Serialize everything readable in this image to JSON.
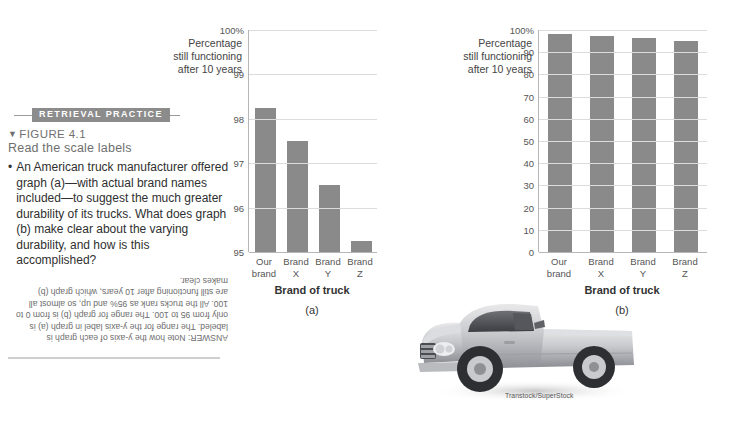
{
  "sidebar": {
    "badge": "RETRIEVAL PRACTICE",
    "figure_marker": "▼",
    "figure_number": "FIGURE 4.1",
    "figure_title": "Read the scale labels",
    "bullet_glyph": "•",
    "question": "An American truck manufacturer offered graph (a)—with actual brand names included—to suggest the much greater durability of its trucks. What does graph (b) make clear about the varying durability, and how is this accomplished?",
    "answer": "ANSWER: Note how the y-axis of each graph is labeled. The range for the y-axis label in graph (a) is only from 95 to 100. The range for graph (b) is from 0 to 100. All the trucks rank as 95% and up, so almost all are still functioning after 10 years, which graph (b) makes clear."
  },
  "photo": {
    "credit": "Transtock/SuperStock",
    "subject": "silver-pickup-truck"
  },
  "colors": {
    "bar_fill": "#8a8a8a",
    "gridline": "#dcdcdc",
    "axis": "#b6b6b6",
    "badge_bg": "#8c8c8c"
  },
  "chart_data": [
    {
      "type": "bar",
      "panel": "(a)",
      "title": "",
      "ylabel": "Percentage still functioning after 10 years",
      "ylabel_lines": [
        "Percentage",
        "still functioning",
        "after 10 years"
      ],
      "xlabel": "Brand of truck",
      "categories": [
        "Our brand",
        "Brand X",
        "Brand Y",
        "Brand Z"
      ],
      "category_lines": [
        [
          "Our",
          "brand"
        ],
        [
          "Brand",
          "X"
        ],
        [
          "Brand",
          "Y"
        ],
        [
          "Brand",
          "Z"
        ]
      ],
      "values": [
        98.25,
        97.5,
        96.5,
        95.25
      ],
      "ylim": [
        95,
        100
      ],
      "yticks": [
        95,
        96,
        97,
        98,
        99,
        100
      ],
      "ytick_labels": [
        "95",
        "96",
        "97",
        "98",
        "99",
        "100%"
      ],
      "grid": true,
      "legend": "none"
    },
    {
      "type": "bar",
      "panel": "(b)",
      "title": "",
      "ylabel": "Percentage still functioning after 10 years",
      "ylabel_lines": [
        "Percentage",
        "still functioning",
        "after 10 years"
      ],
      "xlabel": "Brand of truck",
      "categories": [
        "Our brand",
        "Brand X",
        "Brand Y",
        "Brand Z"
      ],
      "category_lines": [
        [
          "Our",
          "brand"
        ],
        [
          "Brand",
          "X"
        ],
        [
          "Brand",
          "Y"
        ],
        [
          "Brand",
          "Z"
        ]
      ],
      "values": [
        98.25,
        97.5,
        96.5,
        95.25
      ],
      "ylim": [
        0,
        100
      ],
      "yticks": [
        0,
        10,
        20,
        30,
        40,
        50,
        60,
        70,
        80,
        90,
        100
      ],
      "ytick_labels": [
        "0",
        "10",
        "20",
        "30",
        "40",
        "50",
        "60",
        "70",
        "80",
        "90",
        "100%"
      ],
      "grid": true,
      "legend": "none"
    }
  ]
}
